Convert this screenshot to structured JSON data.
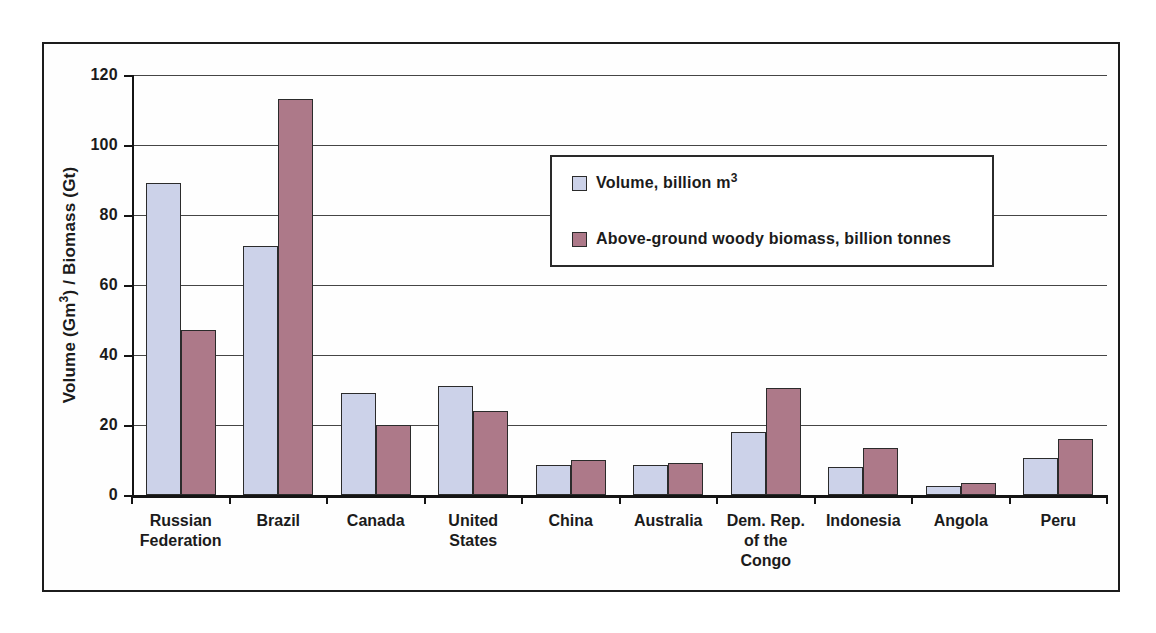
{
  "figure": {
    "background_color": "#ffffff",
    "frame_border_color": "#1c1c1c"
  },
  "y_axis": {
    "title_pre": "Volume (Gm",
    "title_sup": "3",
    "title_post": ") / Biomass (Gt)",
    "tick_labels": [
      "0",
      "20",
      "40",
      "60",
      "80",
      "100",
      "120"
    ]
  },
  "legend": {
    "entries": [
      {
        "label_pre": "Volume, billion m",
        "label_sup": "3",
        "color": "#ccd2e9"
      },
      {
        "label_pre": "Above-ground woody biomass, billion tonnes",
        "label_sup": "",
        "color": "#ad7989"
      }
    ]
  },
  "chart_data": {
    "type": "bar",
    "title": "",
    "xlabel": "",
    "ylabel": "Volume (Gm³) / Biomass (Gt)",
    "ylim": [
      0,
      120
    ],
    "ytick_step": 20,
    "grid": true,
    "legend_position": "inside plot, upper right",
    "categories": [
      "Russian Federation",
      "Brazil",
      "Canada",
      "United States",
      "China",
      "Australia",
      "Dem. Rep. of the Congo",
      "Indonesia",
      "Angola",
      "Peru"
    ],
    "category_display": [
      "Russian\nFederation",
      "Brazil",
      "Canada",
      "United\nStates",
      "China",
      "Australia",
      "Dem. Rep.\nof the\nCongo",
      "Indonesia",
      "Angola",
      "Peru"
    ],
    "series": [
      {
        "name": "Volume, billion m³",
        "color": "#ccd2e9",
        "values": [
          89,
          71,
          29,
          31,
          8.5,
          8.5,
          18,
          8,
          2.5,
          10.5
        ]
      },
      {
        "name": "Above-ground woody biomass, billion tonnes",
        "color": "#ad7989",
        "values": [
          47,
          113,
          20,
          24,
          10,
          9,
          30.5,
          13.5,
          3.5,
          16
        ]
      }
    ]
  }
}
